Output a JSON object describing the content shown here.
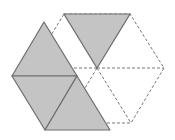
{
  "diagram": {
    "colors": {
      "background": "#ffffff",
      "shaded_fill": "#c4c4c4",
      "solid_stroke": "#6e6e6e",
      "dashed_stroke": "#777777"
    },
    "dashed_hexagon": {
      "center": [
        97,
        68
      ],
      "vertices": [
        [
          64,
          14
        ],
        [
          130,
          14
        ],
        [
          164,
          68
        ],
        [
          131,
          123
        ],
        [
          64,
          123
        ],
        [
          31,
          68
        ]
      ]
    },
    "shaded_top_triangle": [
      [
        64,
        14
      ],
      [
        130,
        14
      ],
      [
        97,
        68
      ]
    ],
    "shaded_left_group": {
      "triangles": [
        [
          [
            44,
            22
          ],
          [
            12,
            76
          ],
          [
            77,
            76
          ]
        ],
        [
          [
            12,
            76
          ],
          [
            77,
            76
          ],
          [
            45,
            130
          ]
        ],
        [
          [
            77,
            76
          ],
          [
            45,
            130
          ],
          [
            110,
            130
          ]
        ]
      ]
    }
  }
}
